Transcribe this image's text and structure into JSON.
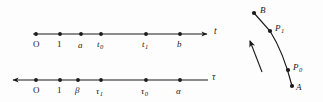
{
  "figure": {
    "title": "",
    "background_color": "#fdfdfd",
    "ink_color": "#1a1a1a",
    "width": 323,
    "height": 102
  },
  "axes": [
    {
      "name": "t-axis",
      "axis_label": "t",
      "arrow_direction": "right",
      "line": {
        "x1": 33,
        "y1": 34,
        "x2": 208,
        "y2": 34
      },
      "label_pos": {
        "x": 214,
        "y": 29
      },
      "ticks": [
        {
          "key": "O",
          "label": "O",
          "sub": "",
          "x": 36,
          "label_x": 33,
          "label_y": 40
        },
        {
          "key": "1",
          "label": "1",
          "sub": "",
          "x": 60,
          "label_x": 57,
          "label_y": 40
        },
        {
          "key": "a",
          "label": "a",
          "sub": "",
          "x": 81,
          "label_x": 78,
          "label_y": 41
        },
        {
          "key": "t0",
          "label": "t",
          "sub": "0",
          "x": 101,
          "label_x": 96,
          "label_y": 40
        },
        {
          "key": "t1",
          "label": "t",
          "sub": "1",
          "x": 146,
          "label_x": 141,
          "label_y": 40
        },
        {
          "key": "b",
          "label": "b",
          "sub": "",
          "x": 180,
          "label_x": 177,
          "label_y": 40
        }
      ]
    },
    {
      "name": "tau-axis",
      "axis_label": "τ",
      "arrow_direction": "left",
      "line": {
        "x1": 12,
        "y1": 80,
        "x2": 208,
        "y2": 80
      },
      "label_pos": {
        "x": 212,
        "y": 75
      },
      "ticks": [
        {
          "key": "O",
          "label": "O",
          "sub": "",
          "x": 36,
          "label_x": 33,
          "label_y": 86
        },
        {
          "key": "1",
          "label": "1",
          "sub": "",
          "x": 60,
          "label_x": 57,
          "label_y": 86
        },
        {
          "key": "beta",
          "label": "β",
          "sub": "",
          "x": 78,
          "label_x": 75,
          "label_y": 86
        },
        {
          "key": "tau1",
          "label": "τ",
          "sub": "1",
          "x": 101,
          "label_x": 96,
          "label_y": 87
        },
        {
          "key": "tau0",
          "label": "τ",
          "sub": "0",
          "x": 146,
          "label_x": 141,
          "label_y": 87
        },
        {
          "key": "alpha",
          "label": "α",
          "sub": "",
          "x": 180,
          "label_x": 176,
          "label_y": 87
        }
      ]
    }
  ],
  "curve": {
    "name": "path-A-to-B",
    "path": "M 292,86 C 288,70 282,50 270,31 L 254,13",
    "direction_arrow": {
      "label": "direction-of-travel",
      "x1": 262,
      "y1": 72,
      "x2": 250,
      "y2": 41
    },
    "points": [
      {
        "key": "B",
        "label": "B",
        "sub": "",
        "x": 254,
        "y": 13,
        "label_x": 260,
        "label_y": 6
      },
      {
        "key": "P1",
        "label": "P",
        "sub": "1",
        "x": 270,
        "y": 31,
        "label_x": 275,
        "label_y": 24
      },
      {
        "key": "P0",
        "label": "P",
        "sub": "0",
        "x": 288,
        "y": 70,
        "label_x": 293,
        "label_y": 63
      },
      {
        "key": "A",
        "label": "A",
        "sub": "",
        "x": 292,
        "y": 86,
        "label_x": 296,
        "label_y": 83
      }
    ]
  }
}
